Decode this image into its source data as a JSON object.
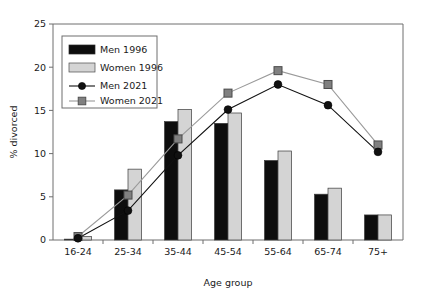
{
  "chart_data": {
    "type": "bar",
    "title": "",
    "xlabel": "Age group",
    "ylabel": "% divorced",
    "categories": [
      "16-24",
      "25-34",
      "35-44",
      "45-54",
      "55-64",
      "65-74",
      "75+"
    ],
    "ylim": [
      0,
      25
    ],
    "yticks": [
      0,
      5,
      10,
      15,
      20,
      25
    ],
    "ytick_labels": [
      "0",
      "5",
      "10",
      "15",
      "20",
      "25"
    ],
    "grid": false,
    "legend_position": "upper left",
    "series": [
      {
        "name": "Men 1996",
        "render": "bar",
        "color": "#0d0d0d",
        "values": [
          0.1,
          5.8,
          13.7,
          13.5,
          9.2,
          5.3,
          2.9
        ]
      },
      {
        "name": "Women 1996",
        "render": "bar",
        "color": "#d4d4d4",
        "values": [
          0.4,
          8.2,
          15.1,
          14.7,
          10.3,
          6.0,
          2.9
        ]
      },
      {
        "name": "Men 2021",
        "render": "line-circle",
        "color": "#111111",
        "values": [
          0.2,
          3.4,
          9.8,
          15.1,
          18.0,
          15.6,
          10.2
        ]
      },
      {
        "name": "Women 2021",
        "render": "line-square",
        "color": "#808080",
        "values": [
          0.4,
          5.2,
          11.7,
          17.0,
          19.6,
          18.0,
          11.0
        ]
      }
    ]
  },
  "legend": {
    "entries": [
      {
        "label": "Men 1996",
        "marker": "filled-black-bar-swatch"
      },
      {
        "label": "Women 1996",
        "marker": "light-gray-bar-swatch"
      },
      {
        "label": "Men 2021",
        "marker": "black-circle-line-swatch"
      },
      {
        "label": "Women 2021",
        "marker": "gray-square-line-swatch"
      }
    ]
  },
  "colors": {
    "men_1996_bar": "#0d0d0d",
    "women_1996_bar": "#d4d4d4",
    "men_2021_line": "#111111",
    "women_2021_line": "#9a9a9a",
    "women_2021_marker": "#808080",
    "axis": "#6e6e6e",
    "text": "#1a1a1a",
    "background": "#ffffff"
  }
}
